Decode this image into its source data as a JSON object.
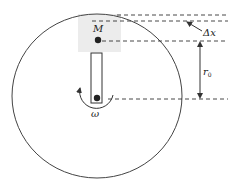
{
  "diagram": {
    "type": "rotating-disk-schematic",
    "labels": {
      "mass": "M",
      "delta_x": "Δx",
      "radius_main": "r",
      "radius_sub": "0",
      "angular_velocity": "ω"
    },
    "colors": {
      "stroke": "#333333",
      "shade": "#ececec",
      "background": "#ffffff"
    }
  }
}
